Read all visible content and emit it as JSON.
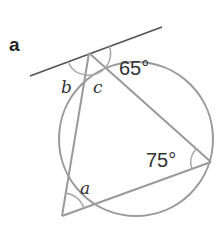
{
  "part_label": "a",
  "angles": {
    "b": "b",
    "c": "c",
    "a": "a",
    "known_top": "65°",
    "known_right": "75°"
  },
  "colors": {
    "circle": "#9a9a9a",
    "chords": "#9a9a9a",
    "tangent": "#555555",
    "arcs": "#a8a8a8",
    "text": "#333333"
  }
}
